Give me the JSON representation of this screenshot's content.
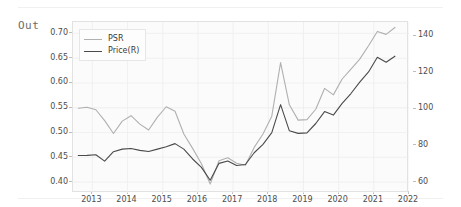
{
  "cell": {
    "out_label": "Out"
  },
  "legend": {
    "position": "upper-left",
    "entries": [
      {
        "label": "PSR",
        "color": "#b0b0b0"
      },
      {
        "label": "Price(R)",
        "color": "#4a4a4a"
      }
    ]
  },
  "chart_data": {
    "type": "line",
    "title": "",
    "xlabel": "",
    "ylabel": "",
    "grid": true,
    "legend_position": "upper left",
    "x": [
      2012.6,
      2012.85,
      2013.1,
      2013.35,
      2013.6,
      2013.85,
      2014.1,
      2014.35,
      2014.6,
      2014.85,
      2015.1,
      2015.35,
      2015.6,
      2015.85,
      2016.1,
      2016.35,
      2016.6,
      2016.85,
      2017.1,
      2017.35,
      2017.6,
      2017.85,
      2018.1,
      2018.35,
      2018.6,
      2018.85,
      2019.1,
      2019.35,
      2019.6,
      2019.85,
      2020.1,
      2020.35,
      2020.6,
      2020.85,
      2021.1,
      2021.35,
      2021.6
    ],
    "xtick_labels": [
      "2013",
      "2014",
      "2015",
      "2016",
      "2017",
      "2018",
      "2019",
      "2020",
      "2021",
      "2022"
    ],
    "xtick_values": [
      2013,
      2014,
      2015,
      2016,
      2017,
      2018,
      2019,
      2020,
      2021,
      2022
    ],
    "xlim": [
      2012.45,
      2022.0
    ],
    "series": [
      {
        "name": "PSR",
        "axis": "left",
        "color": "#b0b0b0",
        "ylim": [
          0.378,
          0.723
        ],
        "ytick_labels": [
          "0.40",
          "0.45",
          "0.50",
          "0.55",
          "0.60",
          "0.65",
          "0.70"
        ],
        "ytick_values": [
          0.4,
          0.45,
          0.5,
          0.55,
          0.6,
          0.65,
          0.7
        ],
        "values": [
          0.549,
          0.551,
          0.546,
          0.524,
          0.498,
          0.523,
          0.534,
          0.517,
          0.505,
          0.531,
          0.552,
          0.543,
          0.497,
          0.468,
          0.437,
          0.396,
          0.443,
          0.449,
          0.438,
          0.434,
          0.47,
          0.497,
          0.533,
          0.641,
          0.556,
          0.525,
          0.526,
          0.547,
          0.589,
          0.576,
          0.608,
          0.628,
          0.648,
          0.675,
          0.704,
          0.698,
          0.712
        ]
      },
      {
        "name": "Price(R)",
        "axis": "right",
        "color": "#4a4a4a",
        "ylim": [
          54.0,
          147.5
        ],
        "ytick_labels": [
          "60",
          "80",
          "100",
          "120",
          "140"
        ],
        "ytick_values": [
          60,
          80,
          100,
          120,
          140
        ],
        "values": [
          74.5,
          74.6,
          74.9,
          71.4,
          76.6,
          78.0,
          78.3,
          77.3,
          76.7,
          78.0,
          79.3,
          81.0,
          78.0,
          72.6,
          68.0,
          61.0,
          70.2,
          71.5,
          69.0,
          69.6,
          76.0,
          80.6,
          87.0,
          102.3,
          88.0,
          86.6,
          86.9,
          92.0,
          98.5,
          96.6,
          103.0,
          108.4,
          114.6,
          120.2,
          128.2,
          125.5,
          128.8
        ]
      }
    ]
  }
}
